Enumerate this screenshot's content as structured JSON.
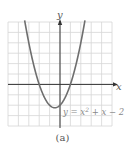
{
  "chart_data": {
    "type": "line",
    "title": "",
    "equation": "y = x² + x − 2",
    "equation_base": "y = x",
    "equation_sup": "2",
    "equation_tail": " + x − 2",
    "xlabel": "x",
    "ylabel": "y",
    "xlim": [
      -5,
      5
    ],
    "ylim": [
      -4,
      6
    ],
    "grid": true,
    "grid_step": 1,
    "series": [
      {
        "name": "y = x^2 + x - 2",
        "function": "x^2 + x - 2",
        "vertex": [
          -0.5,
          -2.25
        ],
        "x_intercepts": [
          -2,
          1
        ],
        "y_intercept": -2,
        "x": [
          -3.4,
          -3,
          -2.5,
          -2,
          -1.5,
          -1,
          -0.5,
          0,
          0.5,
          1,
          1.5,
          2,
          2.4
        ],
        "values": [
          6.16,
          4,
          1.75,
          0,
          -1.25,
          -2,
          -2.25,
          -2,
          -1.25,
          0,
          1.75,
          4,
          6.16
        ]
      }
    ],
    "caption": "(a)"
  },
  "colors": {
    "curve": "#6e6e6e",
    "axis": "#333333",
    "grid": "#d6d6d6",
    "label": "#777777"
  }
}
